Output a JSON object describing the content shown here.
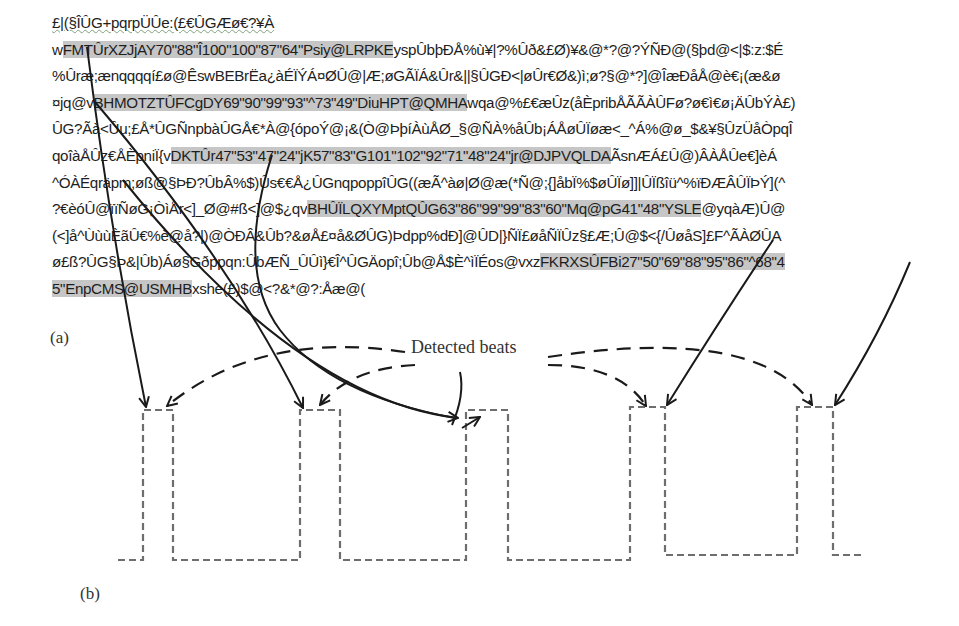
{
  "figure": {
    "panel_a_label": "(a)",
    "panel_b_label": "(b)",
    "annotation": "Detected beats",
    "text_lines": [
      [
        {
          "t": "£|(§ÎÛG+pqrpÜÛe:(£€ÛGÆø€?¥À",
          "s": "squiggle"
        }
      ],
      [
        {
          "t": "w"
        },
        {
          "t": "FMTÛrXZJjAY70\"88\"Î100\"100\"87\"64\"Psiy@LRPKE",
          "s": "hl"
        },
        {
          "t": "yspÛbþÐÅ%ù¥|?%Ûð&£Ø)¥&@*?@?ÝÑÐ@(§þd@<|$:z:$É"
        }
      ],
      [
        {
          "t": "%Ûræ;ænqqqqí£ø@ÊswBEBrËa¿àÉÏÝÁ¤ØÛ@|Æ;øGÃÏÁ&Ûr&||§ÛGÐ<|øÛr€Ø&)ì;ø?§@*?]@ÎæÐåÅ@è€¡(æ&ø"
        }
      ],
      [
        {
          "t": "¤jq@v"
        },
        {
          "t": "BHMOTZTÛFCgDY69\"90\"99\"93\"^73\"49\"DiuHPT@QMHA",
          "s": "hl"
        },
        {
          "t": "wqa@%£€æÛz(åÈpribÅÃÃÀÛFø?ø€ì€ø¡ÄÛbÝÀ£)"
        }
      ],
      [
        {
          "t": "ÛG?Ãà<Ûu;£Å*ÛGÑnpbàÛGÅ€*À@{ópoÝ@¡&(Ò@ÞþíÀùÅØ_§@ÑÀ%åÛb¡ÁÅøÛÏøæ<_^Á%@ø_$&¥§ÛzÜåÒpqÎ"
        }
      ],
      [
        {
          "t": "qoîàÅÛz€ÅÈpniÏ{v"
        },
        {
          "t": "DKTÛr47\"53\"47\"24\"jK57\"83\"G101\"102\"92\"71\"48\"24\"jr@DJPVQLDA",
          "s": "hl"
        },
        {
          "t": "ÃsnÆÁ£Û@)ÂÀÅÛe€]èÁ"
        }
      ],
      [
        {
          "t": "^ÓÀÉqräpm;øß@§ÞÐ?ÛbÂ%$)Ûs€€Å¿ÛGnqpoppîÛG((æÃ^àø|Ø@æ(*Ñ@;{]åbÏ%$øÛÏø]]|ÛÏßîü^%ïÐÆÂÛÏÞÝ](^"
        }
      ],
      [
        {
          "t": "?€èóÛ@ïïÑøG¡ÒìÅr<]_Ø@#ß<]@$¿qv"
        },
        {
          "t": "BHÛÏLQXYMptQÛG63\"86\"99\"99\"83\"60\"Mq@pG41\"48\"YSLE",
          "s": "hl"
        },
        {
          "t": "@yqàÆ)Û@"
        }
      ],
      [
        {
          "t": "(<]å^ÙùùÈãÛ€%è@å?|)@ÒÐÂ&Ûb?&øÅ£¤å&ØÛG)Þdpp%dÐ]@ÛD|}ÑÏ£øåÑÏÛz§£Æ;Û@$<{/ÛøåS]£F^ÃÀØÛA"
        }
      ],
      [
        {
          "t": "ø£ß?ÛG§Þ&|Ûb)Áø§Gðppqn:ÛbÆÑ_ÛÛì}€Î^ÛGÄopî;Ûb@Å$È^ìÏÉos@vxz"
        },
        {
          "t": "FKRXSÛFBi27\"50\"69\"88\"95\"86\"^68\"4",
          "s": "hl"
        }
      ],
      [
        {
          "t": "5\"EnpCMS@USMHB",
          "s": "hl"
        },
        {
          "t": "xshe(£)$@<?&*@?:Åæ@("
        }
      ]
    ]
  },
  "chart_data": {
    "type": "diagram",
    "highlighted_segments": [
      "FMTÛrXZJjAY70\"88\"Î100\"100\"87\"64\"Psiy@LRPKE",
      "BHMOTZTÛFCgDY69\"90\"99\"93\"^73\"49\"DiuHPT@QMHA",
      "DKTÛr47\"53\"47\"24\"jK57\"83\"G101\"102\"92\"71\"48\"24\"jr@DJPVQLDA",
      "BHÛÏLQXYMptQÛG63\"86\"99\"99\"83\"60\"Mq@pG41\"48\"YSLE",
      "FKRXSÛFBi27\"50\"69\"88\"95\"86\"^68\"45\"EnpCMS@USMHB"
    ],
    "pulses": [
      {
        "x_start": 143,
        "x_end": 173
      },
      {
        "x_start": 300,
        "x_end": 340
      },
      {
        "x_start": 466,
        "x_end": 508
      },
      {
        "x_start": 630,
        "x_end": 665
      },
      {
        "x_start": 797,
        "x_end": 833
      }
    ],
    "baseline_y": 560,
    "peak_y": 410,
    "labels": [
      "(a)",
      "(b)",
      "Detected beats"
    ]
  }
}
